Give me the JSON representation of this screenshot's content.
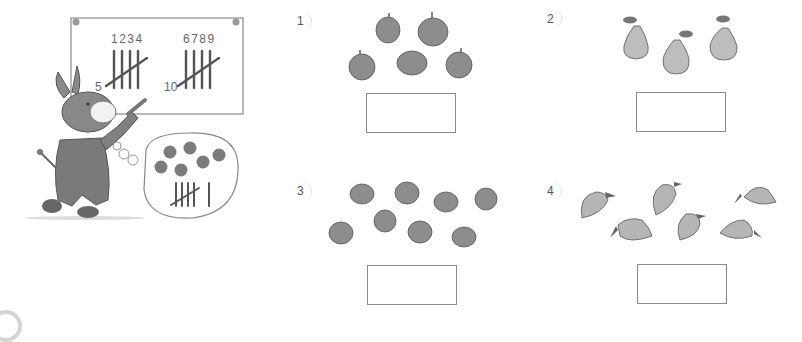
{
  "worksheet": {
    "title": "Tally counting worksheet",
    "example": {
      "board": {
        "group1_numbers": "1234",
        "group1_total": "5",
        "group2_numbers": "6789",
        "group2_total": "10"
      },
      "thought_bubble": {
        "items": "strawberries",
        "count": 6,
        "tally": "5 + 1"
      }
    },
    "questions": [
      {
        "number": "1",
        "label": "1)",
        "fruit": "apple",
        "count": 5,
        "answer": ""
      },
      {
        "number": "2",
        "label": "2)",
        "fruit": "pear",
        "count": 3,
        "answer": ""
      },
      {
        "number": "3",
        "label": "3)",
        "fruit": "orange",
        "count": 8,
        "answer": ""
      },
      {
        "number": "4",
        "label": "4)",
        "fruit": "mango",
        "count": 6,
        "answer": ""
      }
    ]
  }
}
